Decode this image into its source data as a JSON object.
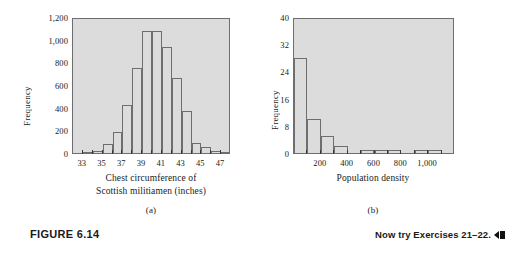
{
  "figure": {
    "label": "FIGURE 6.14",
    "subcaption_a": "(a)",
    "subcaption_b": "(b)",
    "now_try": "Now try Exercises 21–22.",
    "arrow_icon": "rewind-arrow-icon"
  },
  "colors": {
    "plot_background": "#dcdcdc",
    "bar_fill": "#dcdcdc",
    "bar_stroke": "#6e6e6e",
    "axis": "#4a4a4a",
    "text": "#1a1a1a"
  },
  "chart_data": [
    {
      "type": "bar",
      "title": "",
      "panel": "(a)",
      "xlabel": "Chest circumference of\nScottish militiamen (inches)",
      "ylabel": "Frequency",
      "xlim": [
        32,
        48
      ],
      "ylim": [
        0,
        1200
      ],
      "grid": false,
      "legend": "none",
      "ytick_labels": [
        "0",
        "200",
        "400",
        "600",
        "800",
        "1,000",
        "1,200"
      ],
      "ytick_values": [
        0,
        200,
        400,
        600,
        800,
        1000,
        1200
      ],
      "xtick_labels": [
        "33",
        "35",
        "37",
        "39",
        "41",
        "43",
        "45",
        "47"
      ],
      "xtick_values": [
        33,
        35,
        37,
        39,
        41,
        43,
        45,
        47
      ],
      "categories": [
        33,
        34,
        35,
        36,
        37,
        38,
        39,
        40,
        41,
        42,
        43,
        44,
        45,
        46,
        47
      ],
      "values": [
        3,
        18,
        81,
        185,
        420,
        749,
        1073,
        1079,
        934,
        658,
        370,
        92,
        50,
        21,
        4
      ],
      "bin_width": 1
    },
    {
      "type": "bar",
      "title": "",
      "panel": "(b)",
      "xlabel": "Population density",
      "ylabel": "Frequency",
      "xlim": [
        0,
        1200
      ],
      "ylim": [
        0,
        40
      ],
      "grid": false,
      "legend": "none",
      "ytick_labels": [
        "0",
        "8",
        "16",
        "24",
        "32",
        "40"
      ],
      "ytick_values": [
        0,
        8,
        16,
        24,
        32,
        40
      ],
      "xtick_labels": [
        "200",
        "400",
        "600",
        "800",
        "1,000"
      ],
      "xtick_values": [
        200,
        400,
        600,
        800,
        1000
      ],
      "categories": [
        0,
        100,
        200,
        300,
        400,
        500,
        600,
        700,
        800,
        900,
        1000,
        1100
      ],
      "values": [
        28,
        10,
        5,
        2,
        0,
        1,
        1,
        1,
        0,
        1,
        1,
        0
      ],
      "bin_width": 100
    }
  ]
}
